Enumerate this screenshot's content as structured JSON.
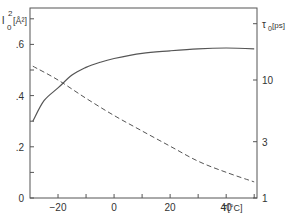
{
  "chart_data": {
    "type": "line",
    "title": "",
    "xlabel": "T[°C]",
    "ylabel_left": "l0² [Å²]",
    "ylabel_right": "τ0 [ps]",
    "xlim": [
      -30,
      51
    ],
    "ylim_left": [
      0,
      0.75
    ],
    "ylim_right_log": [
      1,
      50
    ],
    "x_ticks": [
      -20,
      0,
      20,
      40
    ],
    "x_minor_ticks": [
      -20,
      -10,
      0,
      10,
      20,
      30,
      40,
      50
    ],
    "y_left_ticks": [
      0,
      0.2,
      0.4,
      0.6
    ],
    "y_left_tick_labels": [
      "0",
      ".2",
      ".4",
      ".6"
    ],
    "y_left_minor_ticks": [
      0.1,
      0.3,
      0.5,
      0.7
    ],
    "y_right_ticks": [
      1,
      3,
      10,
      30
    ],
    "y_right_tick_labels": [
      "1",
      "3",
      "10",
      ""
    ],
    "grid": false,
    "series": [
      {
        "name": "l0^2",
        "axis": "left",
        "style": "solid",
        "x": [
          -29,
          -25,
          -20,
          -15,
          -10,
          -5,
          0,
          10,
          20,
          30,
          40,
          50
        ],
        "values": [
          0.3,
          0.38,
          0.43,
          0.48,
          0.51,
          0.53,
          0.545,
          0.565,
          0.575,
          0.583,
          0.586,
          0.583
        ]
      },
      {
        "name": "tau0",
        "axis": "right",
        "style": "dashed",
        "x": [
          -29,
          -20,
          -10,
          0,
          10,
          20,
          30,
          40,
          50
        ],
        "values": [
          13.1,
          10.0,
          7.0,
          5.0,
          3.7,
          2.75,
          2.05,
          1.65,
          1.37
        ]
      }
    ]
  },
  "labels": {
    "x_axis_title": "T[°C]",
    "left_axis_title_main": "l",
    "left_axis_title_sup": "2",
    "left_axis_title_sub": "0",
    "left_axis_title_unit": "[Å²]",
    "right_axis_title_main": "τ",
    "right_axis_title_sub": "0",
    "right_axis_title_unit": "[ps]"
  }
}
